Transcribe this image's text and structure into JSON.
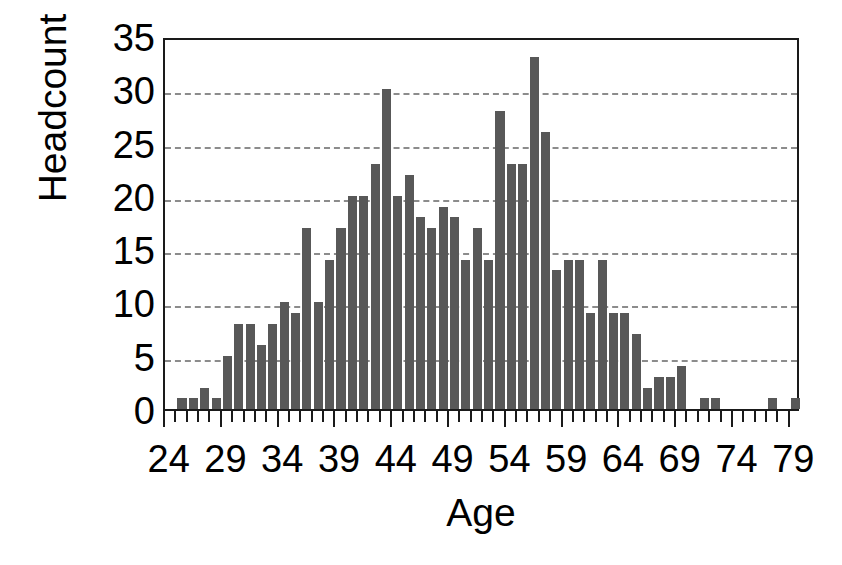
{
  "chart_data": {
    "type": "bar",
    "title": "",
    "xlabel": "Age",
    "ylabel": "Headcount",
    "xlim": [
      23.5,
      79.5
    ],
    "ylim": [
      0,
      35
    ],
    "ytick_values": [
      0,
      5,
      10,
      15,
      20,
      25,
      30,
      35
    ],
    "ytick_labels": [
      "0",
      "5",
      "10",
      "15",
      "20",
      "25",
      "30",
      "35"
    ],
    "xtick_values": [
      24,
      29,
      34,
      39,
      44,
      49,
      54,
      59,
      64,
      69,
      74,
      79
    ],
    "xtick_labels": [
      "24",
      "29",
      "34",
      "39",
      "44",
      "49",
      "54",
      "59",
      "64",
      "69",
      "74",
      "79"
    ],
    "grid": "horizontal-dashed",
    "legend": "none",
    "bar_color": "#585858",
    "axis_color": "#1a1a1a",
    "gridline_color": "#8c8c8c",
    "categories": [
      24,
      25,
      26,
      27,
      28,
      29,
      30,
      31,
      32,
      33,
      34,
      35,
      36,
      37,
      38,
      39,
      40,
      41,
      42,
      43,
      44,
      45,
      46,
      47,
      48,
      49,
      50,
      51,
      52,
      53,
      54,
      55,
      56,
      57,
      58,
      59,
      60,
      61,
      62,
      63,
      64,
      65,
      66,
      67,
      68,
      69,
      70,
      71,
      72,
      73,
      74,
      75,
      76,
      77,
      78,
      79
    ],
    "values": [
      0,
      1,
      1,
      2,
      1,
      5,
      8,
      8,
      6,
      8,
      10,
      9,
      17,
      10,
      14,
      17,
      20,
      20,
      23,
      30,
      20,
      22,
      18,
      17,
      19,
      18,
      14,
      17,
      14,
      28,
      23,
      23,
      33,
      26,
      13,
      14,
      14,
      9,
      14,
      9,
      9,
      7,
      2,
      3,
      3,
      4,
      0,
      1,
      1,
      0,
      0,
      0,
      0,
      1,
      0,
      1
    ],
    "series_name": "Headcount by age"
  },
  "axis": {
    "y_title": "Headcount",
    "x_title": "Age"
  }
}
